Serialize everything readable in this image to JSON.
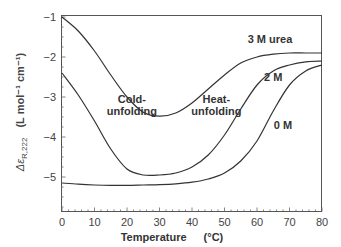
{
  "chart_data": {
    "type": "line",
    "title": "",
    "xlabel": "Temperature",
    "xlabel_unit": "(°C)",
    "ylabel_symbol": "Δε",
    "ylabel_subscript": "R,222",
    "ylabel_unit": "(L mol⁻¹ cm⁻¹)",
    "xlim": [
      0,
      80
    ],
    "ylim": [
      -5.87,
      -1
    ],
    "x_ticks": [
      0,
      10,
      20,
      30,
      40,
      50,
      60,
      70,
      80
    ],
    "y_ticks": [
      -1,
      -2,
      -3,
      -4,
      -5
    ],
    "grid": false,
    "series": [
      {
        "name": "3 M urea",
        "x": [
          0,
          5,
          10,
          15,
          20,
          25,
          30,
          35,
          40,
          45,
          50,
          55,
          60,
          65,
          70,
          75,
          80
        ],
        "values": [
          -1.0,
          -1.35,
          -1.85,
          -2.45,
          -3.0,
          -3.38,
          -3.48,
          -3.4,
          -3.15,
          -2.8,
          -2.45,
          -2.15,
          -2.0,
          -1.93,
          -1.9,
          -1.9,
          -1.9
        ]
      },
      {
        "name": "2 M",
        "x": [
          0,
          5,
          10,
          15,
          20,
          25,
          30,
          35,
          40,
          45,
          50,
          55,
          60,
          65,
          70,
          75,
          80
        ],
        "values": [
          -2.4,
          -2.95,
          -3.6,
          -4.3,
          -4.8,
          -4.95,
          -4.95,
          -4.9,
          -4.75,
          -4.45,
          -3.95,
          -3.3,
          -2.7,
          -2.35,
          -2.2,
          -2.12,
          -2.1
        ]
      },
      {
        "name": "0 M",
        "x": [
          0,
          5,
          10,
          15,
          20,
          25,
          30,
          35,
          40,
          45,
          50,
          55,
          60,
          65,
          70,
          75,
          80
        ],
        "values": [
          -5.15,
          -5.18,
          -5.2,
          -5.21,
          -5.21,
          -5.2,
          -5.19,
          -5.17,
          -5.13,
          -5.05,
          -4.9,
          -4.6,
          -4.1,
          -3.35,
          -2.7,
          -2.35,
          -2.2
        ]
      }
    ],
    "annotations": [
      {
        "text": "3 M urea",
        "x": 64,
        "y": -1.65
      },
      {
        "text": "2 M",
        "x": 65,
        "y": -2.6
      },
      {
        "text": "0 M",
        "x": 68,
        "y": -3.8
      },
      {
        "text": "Cold-",
        "x": 21.5,
        "y": -3.15
      },
      {
        "text": "unfolding",
        "x": 21.5,
        "y": -3.45
      },
      {
        "text": "Heat-",
        "x": 47.5,
        "y": -3.15
      },
      {
        "text": "unfolding",
        "x": 47.5,
        "y": -3.45
      }
    ]
  }
}
